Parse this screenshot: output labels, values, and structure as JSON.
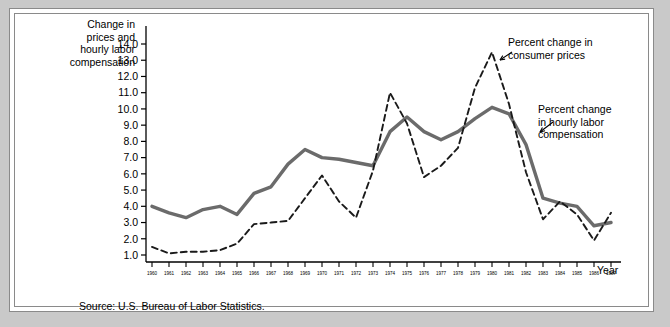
{
  "figure": {
    "y_axis_title": "Change in\nprices and\nhourly labor\ncompensation",
    "x_axis_title": "Year",
    "source": "Source:  U.S. Bureau of Labor Statistics.",
    "annotation_cpi": "Percent change in\nconsumer prices",
    "annotation_comp": "Percent change\nin hourly labor\ncompensation",
    "series_color_solid": "#6b6b6b",
    "series_color_dashed": "#1a1a1a",
    "frame_color": "#8a8a8a",
    "page_background": "#c9c9c9"
  },
  "chart_data": {
    "type": "line",
    "title": "",
    "xlabel": "Year",
    "ylabel": "Change in prices and hourly labor compensation",
    "xlim": [
      1960,
      1987
    ],
    "ylim": [
      0.6,
      14.4
    ],
    "yticks": [
      "1.0",
      "2.0",
      "3.0",
      "4.0",
      "5.0",
      "6.0",
      "7.0",
      "8.0",
      "9.0",
      "10.0",
      "11.0",
      "12.0",
      "13.0",
      "14.0"
    ],
    "grid": false,
    "legend": "annotations",
    "categories": [
      "1960",
      "1961",
      "1962",
      "1963",
      "1964",
      "1965",
      "1966",
      "1967",
      "1968",
      "1969",
      "1970",
      "1971",
      "1972",
      "1973",
      "1974",
      "1975",
      "1976",
      "1977",
      "1978",
      "1979",
      "1980",
      "1981",
      "1982",
      "1983",
      "1984",
      "1985",
      "1986",
      "1987"
    ],
    "series": [
      {
        "name": "Percent change in hourly labor compensation",
        "style": "solid",
        "color": "#6b6b6b",
        "values": [
          4.0,
          3.6,
          3.3,
          3.8,
          4.0,
          3.5,
          4.8,
          5.2,
          6.6,
          7.5,
          7.0,
          6.9,
          6.7,
          6.5,
          8.6,
          9.5,
          8.6,
          8.1,
          8.6,
          9.4,
          10.1,
          9.7,
          7.8,
          4.5,
          4.2,
          4.0,
          2.8,
          3.0
        ]
      },
      {
        "name": "Percent change in consumer prices",
        "style": "dashed",
        "color": "#1a1a1a",
        "values": [
          1.5,
          1.1,
          1.2,
          1.2,
          1.3,
          1.7,
          2.9,
          3.0,
          3.1,
          4.5,
          5.9,
          4.3,
          3.3,
          6.2,
          11.0,
          9.1,
          5.8,
          6.5,
          7.6,
          11.3,
          13.5,
          10.3,
          6.1,
          3.2,
          4.3,
          3.5,
          1.9,
          3.6
        ]
      }
    ],
    "annotations": [
      {
        "text": "Percent change in consumer prices",
        "points_to_year": 1980
      },
      {
        "text": "Percent change in hourly labor compensation",
        "points_to_year": 1982
      }
    ]
  }
}
